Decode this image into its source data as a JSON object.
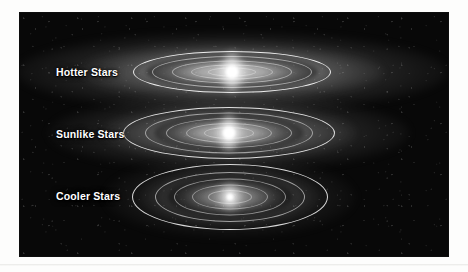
{
  "figure": {
    "background_color": "#080808",
    "caption_rule_color": "#e8e8e6",
    "label_color": "#ffffff",
    "systems": [
      {
        "id": "hotter-stars",
        "label": "Hotter Stars",
        "label_top": 66,
        "center_x": 232,
        "center_y": 72,
        "haze": {
          "width": 430,
          "height": 78,
          "inner_alpha": 0.88,
          "tint": "#dcdcdc"
        },
        "belt": {
          "width": 172,
          "height": 34,
          "color": "#8e8e8e"
        },
        "rings": [
          {
            "width": 198,
            "height": 42,
            "alpha": 0.95
          },
          {
            "width": 160,
            "height": 32,
            "alpha": 0.55
          },
          {
            "width": 120,
            "height": 23,
            "alpha": 0.5
          },
          {
            "width": 82,
            "height": 15,
            "alpha": 0.45
          },
          {
            "width": 48,
            "height": 9,
            "alpha": 0.4
          }
        ],
        "star": {
          "core": 13,
          "glow": 34,
          "plume_w": 17,
          "plume_h": 44
        }
      },
      {
        "id": "sunlike-stars",
        "label": "Sunlike Stars",
        "label_top": 128,
        "center_x": 229,
        "center_y": 133,
        "haze": {
          "width": 360,
          "height": 74,
          "inner_alpha": 0.78,
          "tint": "#d4d4d4"
        },
        "belt": {
          "width": 150,
          "height": 38,
          "color": "#8a8a8a"
        },
        "rings": [
          {
            "width": 212,
            "height": 52,
            "alpha": 0.9
          },
          {
            "width": 168,
            "height": 41,
            "alpha": 0.55
          },
          {
            "width": 126,
            "height": 30,
            "alpha": 0.5
          },
          {
            "width": 86,
            "height": 20,
            "alpha": 0.45
          },
          {
            "width": 50,
            "height": 12,
            "alpha": 0.4
          }
        ],
        "star": {
          "core": 13,
          "glow": 32,
          "plume_w": 16,
          "plume_h": 40
        }
      },
      {
        "id": "cooler-stars",
        "label": "Cooler Stars",
        "label_top": 190,
        "center_x": 230,
        "center_y": 197,
        "haze": {
          "width": 250,
          "height": 80,
          "inner_alpha": 0.52,
          "tint": "#b8b8b8"
        },
        "belt": {
          "width": 124,
          "height": 42,
          "color": "#6e6e6e"
        },
        "rings": [
          {
            "width": 196,
            "height": 66,
            "alpha": 0.88
          },
          {
            "width": 150,
            "height": 50,
            "alpha": 0.6
          },
          {
            "width": 112,
            "height": 37,
            "alpha": 0.52
          },
          {
            "width": 76,
            "height": 25,
            "alpha": 0.46
          },
          {
            "width": 44,
            "height": 14,
            "alpha": 0.4
          }
        ],
        "star": {
          "core": 7,
          "glow": 30,
          "plume_w": 9,
          "plume_h": 22
        }
      }
    ]
  }
}
